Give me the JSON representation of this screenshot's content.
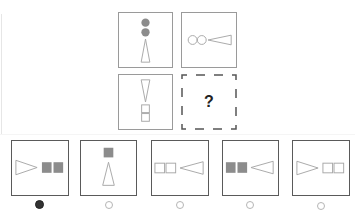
{
  "puzzle": {
    "type": "2x2 figure matrix",
    "missing_label": "?",
    "colors": {
      "outline": "#9a9a9a",
      "fill_gray": "#8c8c8c",
      "option_border": "#5a5a5a",
      "selected_radio": "#333333"
    },
    "grid": [
      {
        "position": "top-left",
        "description": "two gray filled circles stacked above an upward-pointing outlined triangle"
      },
      {
        "position": "top-right",
        "description": "two outlined circles left of a left-pointing outlined triangle"
      },
      {
        "position": "bottom-left",
        "description": "downward-pointing outlined triangle above two outlined squares stacked"
      },
      {
        "position": "bottom-right",
        "description": "missing cell with dashed border",
        "label": "?"
      }
    ]
  },
  "options": [
    {
      "index": 1,
      "description": "right-pointing outlined triangle left of two gray filled squares",
      "selected": true
    },
    {
      "index": 2,
      "description": "gray filled square above upward-pointing outlined triangle",
      "selected": false
    },
    {
      "index": 3,
      "description": "two outlined squares left of a left-pointing outlined triangle",
      "selected": false
    },
    {
      "index": 4,
      "description": "two gray filled squares left of a left-pointing outlined triangle",
      "selected": false
    },
    {
      "index": 5,
      "description": "right-pointing outlined triangle left of two outlined squares",
      "selected": false
    }
  ]
}
